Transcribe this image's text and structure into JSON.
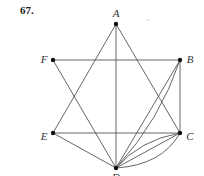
{
  "problem_number": "67.",
  "graph": {
    "vertices": [
      {
        "id": "A",
        "label": "A",
        "x": 116,
        "y": 24,
        "lx": 116,
        "ly": 17
      },
      {
        "id": "B",
        "label": "B",
        "x": 180,
        "y": 60,
        "lx": 190,
        "ly": 63
      },
      {
        "id": "C",
        "label": "C",
        "x": 180,
        "y": 133,
        "lx": 190,
        "ly": 140
      },
      {
        "id": "D",
        "label": "D",
        "x": 116,
        "y": 168,
        "lx": 116,
        "ly": 181
      },
      {
        "id": "E",
        "label": "E",
        "x": 53,
        "y": 133,
        "lx": 44,
        "ly": 140
      },
      {
        "id": "F",
        "label": "F",
        "x": 53,
        "y": 60,
        "lx": 44,
        "ly": 63
      }
    ],
    "edges": [
      {
        "from": "A",
        "to": "E",
        "type": "straight"
      },
      {
        "from": "A",
        "to": "D",
        "type": "straight"
      },
      {
        "from": "A",
        "to": "C",
        "type": "straight"
      },
      {
        "from": "F",
        "to": "B",
        "type": "straight"
      },
      {
        "from": "F",
        "to": "D",
        "type": "straight"
      },
      {
        "from": "B",
        "to": "C",
        "type": "straight"
      },
      {
        "from": "B",
        "to": "D",
        "type": "straight"
      },
      {
        "from": "B",
        "to": "D",
        "type": "curved",
        "cx": 160,
        "cy": 120
      },
      {
        "from": "E",
        "to": "C",
        "type": "straight"
      },
      {
        "from": "E",
        "to": "D",
        "type": "straight"
      },
      {
        "from": "C",
        "to": "D",
        "type": "curved",
        "cx": 140,
        "cy": 140
      },
      {
        "from": "C",
        "to": "D",
        "type": "straight"
      },
      {
        "from": "C",
        "to": "D",
        "type": "curved",
        "cx": 162,
        "cy": 165
      }
    ]
  }
}
